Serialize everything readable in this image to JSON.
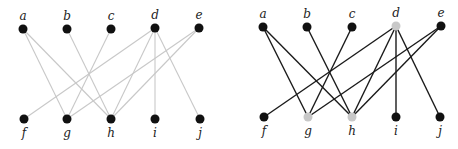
{
  "graphs": [
    {
      "id": "left",
      "edge_color": "#c8c8c8",
      "edge_width": 1.1,
      "nodes": [
        {
          "id": "a",
          "label": "a",
          "x": 23,
          "y": 29,
          "color": "#111111",
          "label_pos": "top"
        },
        {
          "id": "b",
          "label": "b",
          "x": 67,
          "y": 29,
          "color": "#111111",
          "label_pos": "top"
        },
        {
          "id": "c",
          "label": "c",
          "x": 111,
          "y": 29,
          "color": "#111111",
          "label_pos": "top"
        },
        {
          "id": "d",
          "label": "d",
          "x": 155,
          "y": 28,
          "color": "#111111",
          "label_pos": "top"
        },
        {
          "id": "e",
          "label": "e",
          "x": 199,
          "y": 28,
          "color": "#111111",
          "label_pos": "top"
        },
        {
          "id": "f",
          "label": "f",
          "x": 24,
          "y": 119,
          "color": "#111111",
          "label_pos": "bottom"
        },
        {
          "id": "g",
          "label": "g",
          "x": 67,
          "y": 119,
          "color": "#111111",
          "label_pos": "bottom"
        },
        {
          "id": "h",
          "label": "h",
          "x": 111,
          "y": 119,
          "color": "#111111",
          "label_pos": "bottom"
        },
        {
          "id": "i",
          "label": "i",
          "x": 155,
          "y": 119,
          "color": "#111111",
          "label_pos": "bottom"
        },
        {
          "id": "j",
          "label": "j",
          "x": 200,
          "y": 119,
          "color": "#111111",
          "label_pos": "bottom"
        }
      ],
      "edges": [
        [
          "a",
          "g"
        ],
        [
          "a",
          "h"
        ],
        [
          "b",
          "h"
        ],
        [
          "c",
          "g"
        ],
        [
          "d",
          "f"
        ],
        [
          "d",
          "h"
        ],
        [
          "d",
          "i"
        ],
        [
          "d",
          "j"
        ],
        [
          "e",
          "g"
        ],
        [
          "e",
          "h"
        ]
      ]
    },
    {
      "id": "right",
      "edge_color": "#1a1a1a",
      "edge_width": 1.4,
      "nodes": [
        {
          "id": "a",
          "label": "a",
          "x": 263,
          "y": 27,
          "color": "#111111",
          "label_pos": "top"
        },
        {
          "id": "b",
          "label": "b",
          "x": 307,
          "y": 27,
          "color": "#111111",
          "label_pos": "top"
        },
        {
          "id": "c",
          "label": "c",
          "x": 352,
          "y": 27,
          "color": "#111111",
          "label_pos": "top"
        },
        {
          "id": "d",
          "label": "d",
          "x": 396,
          "y": 26,
          "color": "#c8c8c8",
          "label_pos": "top"
        },
        {
          "id": "e",
          "label": "e",
          "x": 441,
          "y": 26,
          "color": "#111111",
          "label_pos": "top"
        },
        {
          "id": "f",
          "label": "f",
          "x": 264,
          "y": 117,
          "color": "#111111",
          "label_pos": "bottom"
        },
        {
          "id": "g",
          "label": "g",
          "x": 308,
          "y": 117,
          "color": "#c8c8c8",
          "label_pos": "bottom"
        },
        {
          "id": "h",
          "label": "h",
          "x": 352,
          "y": 117,
          "color": "#c8c8c8",
          "label_pos": "bottom"
        },
        {
          "id": "i",
          "label": "i",
          "x": 396,
          "y": 117,
          "color": "#111111",
          "label_pos": "bottom"
        },
        {
          "id": "j",
          "label": "j",
          "x": 440,
          "y": 117,
          "color": "#111111",
          "label_pos": "bottom"
        }
      ],
      "edges": [
        [
          "a",
          "g"
        ],
        [
          "a",
          "h"
        ],
        [
          "b",
          "h"
        ],
        [
          "c",
          "g"
        ],
        [
          "d",
          "f"
        ],
        [
          "d",
          "h"
        ],
        [
          "d",
          "i"
        ],
        [
          "d",
          "j"
        ],
        [
          "e",
          "g"
        ],
        [
          "e",
          "h"
        ]
      ]
    }
  ],
  "label_color": "#222222",
  "node_radius": 4.5
}
